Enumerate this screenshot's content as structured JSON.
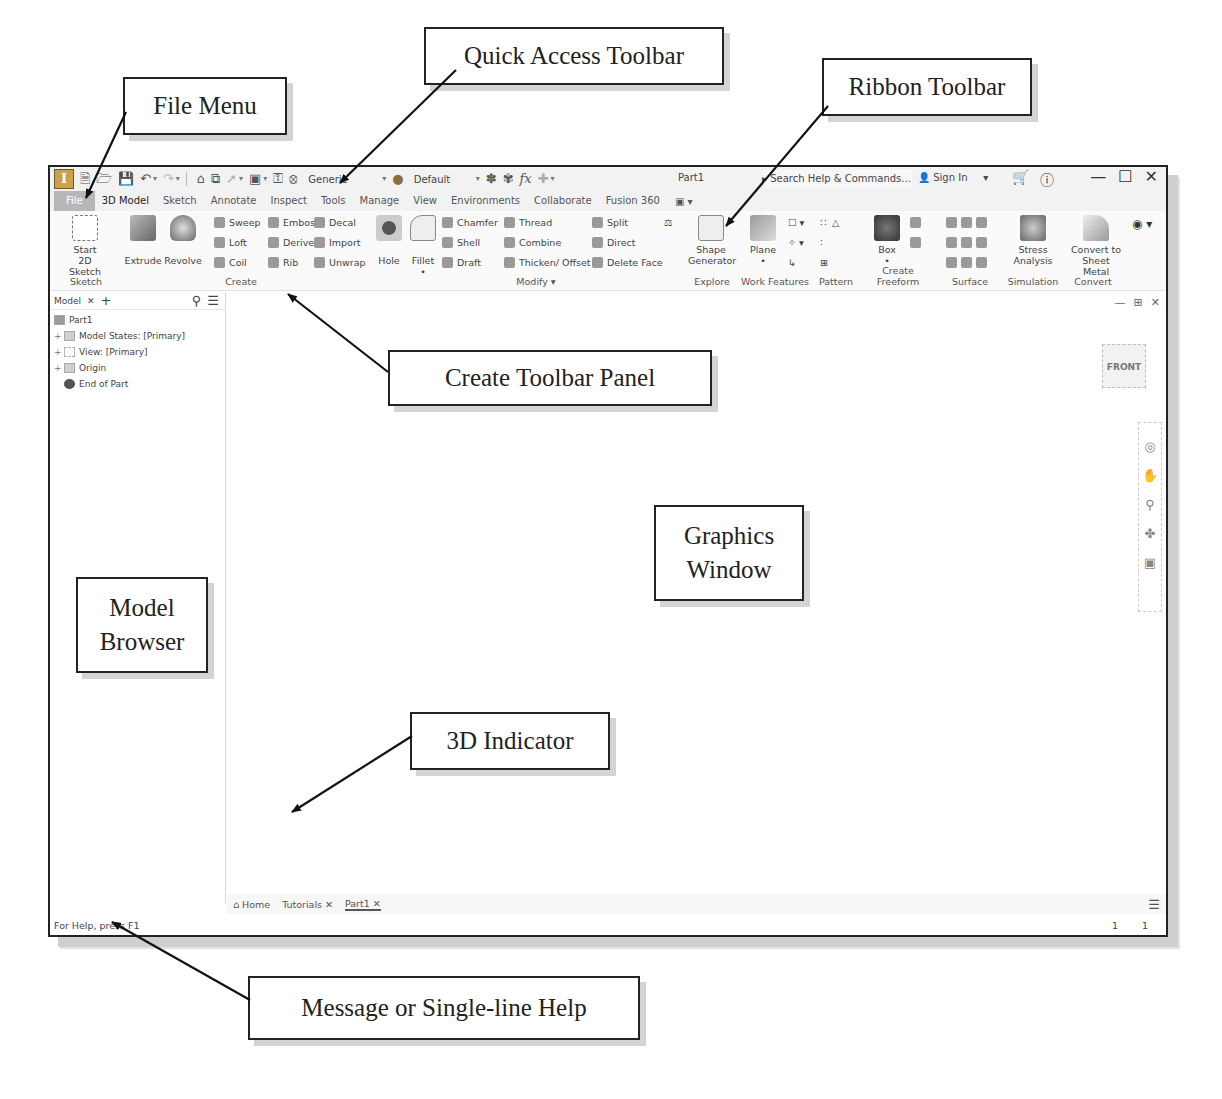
{
  "callouts": {
    "file_menu": "File Menu",
    "quick_access": "Quick Access Toolbar",
    "ribbon_toolbar": "Ribbon Toolbar",
    "create_panel": "Create Toolbar Panel",
    "graphics_line1": "Graphics",
    "graphics_line2": "Window",
    "browser_line1": "Model",
    "browser_line2": "Browser",
    "indicator": "3D Indicator",
    "help": "Message or Single-line Help"
  },
  "qat": {
    "logo": "I",
    "material": "Generic",
    "appearance": "Default",
    "doc_title": "Part1",
    "search_placeholder": "Search Help & Commands...",
    "sign_in": "Sign In"
  },
  "tabs": [
    "File",
    "3D Model",
    "Sketch",
    "Annotate",
    "Inspect",
    "Tools",
    "Manage",
    "View",
    "Environments",
    "Collaborate",
    "Fusion 360"
  ],
  "ribbon": {
    "sketch": {
      "title": "Sketch",
      "start_line1": "Start",
      "start_line2": "2D Sketch"
    },
    "create": {
      "title": "Create",
      "extrude": "Extrude",
      "revolve": "Revolve",
      "sweep": "Sweep",
      "loft": "Loft",
      "coil": "Coil",
      "emboss": "Emboss",
      "derive": "Derive",
      "rib": "Rib",
      "decal": "Decal",
      "import": "Import",
      "unwrap": "Unwrap"
    },
    "modify": {
      "title": "Modify",
      "hole": "Hole",
      "fillet": "Fillet",
      "chamfer": "Chamfer",
      "shell": "Shell",
      "draft": "Draft",
      "thread": "Thread",
      "combine": "Combine",
      "thicken": "Thicken/ Offset",
      "split": "Split",
      "direct": "Direct",
      "delete_face": "Delete Face"
    },
    "explore": {
      "title": "Explore",
      "line1": "Shape",
      "line2": "Generator"
    },
    "work_features": {
      "title": "Work Features",
      "plane": "Plane"
    },
    "pattern": {
      "title": "Pattern"
    },
    "freeform": {
      "title": "Create Freeform",
      "box": "Box"
    },
    "surface": {
      "title": "Surface"
    },
    "simulation": {
      "title": "Simulation",
      "line1": "Stress",
      "line2": "Analysis"
    },
    "convert": {
      "title": "Convert",
      "line1": "Convert to",
      "line2": "Sheet Metal"
    }
  },
  "browser": {
    "tab": "Model",
    "tree": [
      "Part1",
      "Model States: [Primary]",
      "View: [Primary]",
      "Origin",
      "End of Part"
    ]
  },
  "graphics": {
    "viewcube": "FRONT",
    "axis_x": "X",
    "axis_y": "Y"
  },
  "doc_tabs": [
    "Home",
    "Tutorials",
    "Part1"
  ],
  "status": {
    "message": "For Help, press F1",
    "count1": "1",
    "count2": "1"
  }
}
